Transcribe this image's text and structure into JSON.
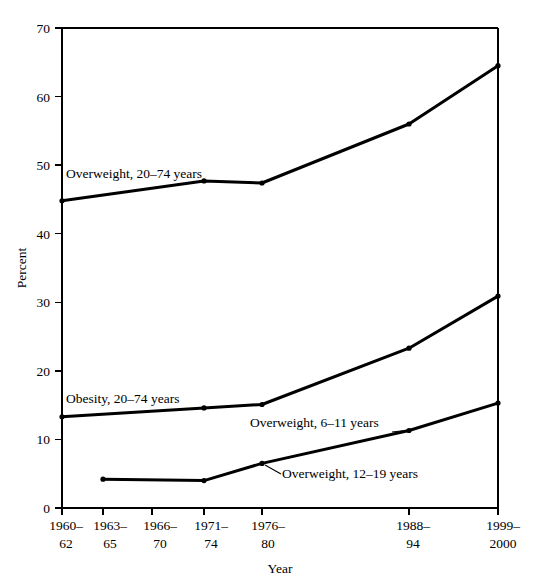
{
  "chart_data": {
    "type": "line",
    "title": "",
    "xlabel": "Year",
    "ylabel": "Percent",
    "ylim": [
      0,
      70
    ],
    "ytick_step": 10,
    "yticks": [
      "0",
      "10",
      "20",
      "30",
      "40",
      "50",
      "60",
      "70"
    ],
    "grid": false,
    "legend_position": "inline-annotations",
    "categories": [
      "1960–62",
      "1963–65",
      "1966–70",
      "1971–74",
      "1976–80",
      "1988–94",
      "1999–2000"
    ],
    "category_lines": [
      {
        "top": "1960–",
        "bottom": "62"
      },
      {
        "top": "1963–",
        "bottom": "65"
      },
      {
        "top": "1966–",
        "bottom": "70"
      },
      {
        "top": "1971–",
        "bottom": "74"
      },
      {
        "top": "1976–",
        "bottom": "80"
      },
      {
        "top": "1988–",
        "bottom": "94"
      },
      {
        "top": "1999–",
        "bottom": "2000"
      }
    ],
    "series": [
      {
        "name": "Overweight, 20–74 years",
        "label": "Overweight, 20–74 years",
        "color": "#000000",
        "points": [
          {
            "x": "1960–62",
            "y": 44.8
          },
          {
            "x": "1971–74",
            "y": 47.7
          },
          {
            "x": "1976–80",
            "y": 47.4
          },
          {
            "x": "1988–94",
            "y": 56.0
          },
          {
            "x": "1999–2000",
            "y": 64.5
          }
        ]
      },
      {
        "name": "Obesity, 20–74 years",
        "label": "Obesity, 20–74 years",
        "color": "#000000",
        "points": [
          {
            "x": "1960–62",
            "y": 13.3
          },
          {
            "x": "1971–74",
            "y": 14.6
          },
          {
            "x": "1976–80",
            "y": 15.1
          },
          {
            "x": "1988–94",
            "y": 23.3
          },
          {
            "x": "1999–2000",
            "y": 30.9
          }
        ]
      },
      {
        "name": "Overweight, 6–11 years",
        "label": "Overweight, 6–11 years",
        "color": "#000000",
        "points": [
          {
            "x": "1963–65",
            "y": 4.2
          },
          {
            "x": "1971–74",
            "y": 4.0
          },
          {
            "x": "1976–80",
            "y": 6.5
          },
          {
            "x": "1988–94",
            "y": 11.3
          },
          {
            "x": "1999–2000",
            "y": 15.3
          }
        ]
      },
      {
        "name": "Overweight, 12–19 years",
        "label": "Overweight, 12–19 years",
        "color": "#000000",
        "points": []
      }
    ],
    "annotations": [
      {
        "text": "Overweight, 20–74 years",
        "x_px": 66,
        "y_px": 178
      },
      {
        "text": "Obesity, 20–74 years",
        "x_px": 66,
        "y_px": 403
      },
      {
        "text": "Overweight, 6–11 years",
        "x_px": 250,
        "y_px": 427
      },
      {
        "text": "Overweight, 12–19 years",
        "x_px": 282,
        "y_px": 478
      }
    ]
  }
}
